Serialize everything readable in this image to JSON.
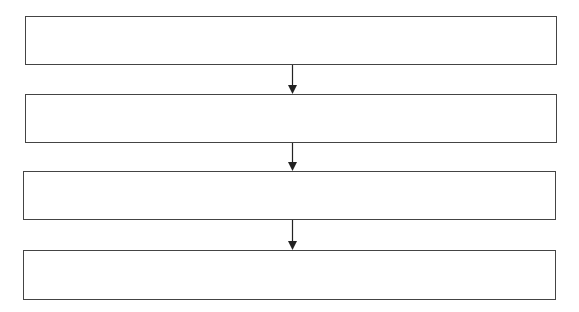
{
  "diagram": {
    "type": "vertical-flowchart",
    "stroke_color": "#444444",
    "background": "#ffffff",
    "boxes": [
      {
        "label": ""
      },
      {
        "label": ""
      },
      {
        "label": ""
      },
      {
        "label": ""
      }
    ],
    "arrows": [
      {
        "from": 0,
        "to": 1,
        "direction": "down"
      },
      {
        "from": 1,
        "to": 2,
        "direction": "down"
      },
      {
        "from": 2,
        "to": 3,
        "direction": "down"
      }
    ]
  }
}
